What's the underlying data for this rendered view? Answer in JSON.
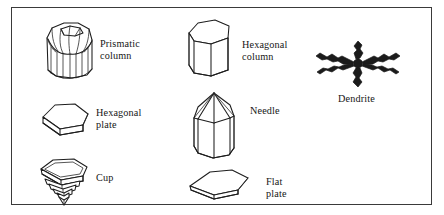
{
  "figure": {
    "border_color": "#3a3a3a",
    "line_color": "#1d1d1d",
    "background": "#ffffff",
    "entries": [
      {
        "id": "prismatic-column",
        "icon": "prismatic-column-crystal-icon",
        "label": "Prismatic\ncolumn",
        "label_line1": "Prismatic",
        "label_line2": "column"
      },
      {
        "id": "hexagonal-column",
        "icon": "hexagonal-column-crystal-icon",
        "label": "Hexagonal\ncolumn",
        "label_line1": "Hexagonal",
        "label_line2": "column"
      },
      {
        "id": "dendrite",
        "icon": "dendrite-crystal-icon",
        "label": "Dendrite",
        "label_line1": "Dendrite",
        "label_line2": ""
      },
      {
        "id": "hexagonal-plate",
        "icon": "hexagonal-plate-crystal-icon",
        "label": "Hexagonal\nplate",
        "label_line1": "Hexagonal",
        "label_line2": "plate"
      },
      {
        "id": "needle",
        "icon": "needle-crystal-icon",
        "label": "Needle",
        "label_line1": "Needle",
        "label_line2": ""
      },
      {
        "id": "cup",
        "icon": "cup-crystal-icon",
        "label": "Cup",
        "label_line1": "Cup",
        "label_line2": ""
      },
      {
        "id": "flat-plate",
        "icon": "flat-plate-crystal-icon",
        "label": "Flat plate",
        "label_line1": "Flat plate",
        "label_line2": ""
      }
    ]
  }
}
